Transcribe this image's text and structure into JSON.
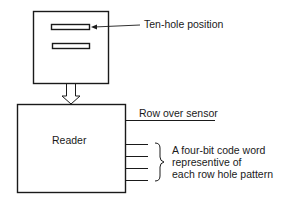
{
  "diagram": {
    "card": {
      "slots": 2,
      "label": "Ten-hole position"
    },
    "reader": {
      "label": "Reader"
    },
    "row_sensor_label": "Row over sensor",
    "output": {
      "line_count": 4,
      "label_lines": [
        "A four-bit code word",
        "representive of",
        "each row hole pattern"
      ]
    },
    "colors": {
      "stroke": "#1a1a1a",
      "background": "#ffffff"
    }
  }
}
